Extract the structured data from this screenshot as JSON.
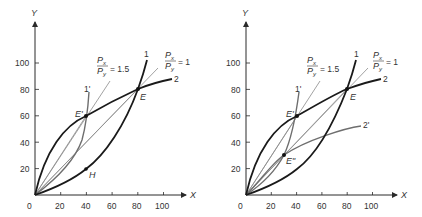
{
  "panels": [
    {
      "id": "left",
      "axes": {
        "x_label": "X",
        "y_label": "Y",
        "origin_label": "0",
        "x_ticks": [
          "20",
          "40",
          "60",
          "80",
          "100"
        ],
        "y_ticks": [
          "20",
          "40",
          "60",
          "80",
          "100"
        ]
      },
      "labels": {
        "curve1": "1",
        "curve2": "2",
        "curve1p": "1'",
        "E": "E",
        "Ep": "E'",
        "H": "H",
        "ratio15_num": "P",
        "ratio15_num_sub": "x",
        "ratio15_den": "P",
        "ratio15_den_sub": "y",
        "ratio15_val": "= 1.5",
        "ratio1_num": "P",
        "ratio1_num_sub": "x",
        "ratio1_den": "P",
        "ratio1_den_sub": "y",
        "ratio1_val": "= 1"
      }
    },
    {
      "id": "right",
      "axes": {
        "x_label": "X",
        "y_label": "Y",
        "origin_label": "0",
        "x_ticks": [
          "20",
          "40",
          "60",
          "80",
          "100"
        ],
        "y_ticks": [
          "20",
          "40",
          "60",
          "80",
          "100"
        ]
      },
      "labels": {
        "curve1": "1",
        "curve2": "2",
        "curve1p": "1'",
        "curve2p": "2'",
        "E": "E",
        "Ep": "E'",
        "Epp": "E\"",
        "ratio15_num": "P",
        "ratio15_num_sub": "x",
        "ratio15_den": "P",
        "ratio15_den_sub": "y",
        "ratio15_val": "= 1.5",
        "ratio1_num": "P",
        "ratio1_num_sub": "x",
        "ratio1_den": "P",
        "ratio1_den_sub": "y",
        "ratio1_val": "= 1"
      }
    }
  ],
  "points": {
    "left": {
      "E": [
        80,
        80
      ],
      "Ep": [
        40,
        60
      ],
      "H": [
        40,
        20
      ]
    },
    "right": {
      "E": [
        80,
        80
      ],
      "Ep": [
        40,
        60
      ],
      "Epp": [
        30,
        30
      ]
    }
  }
}
